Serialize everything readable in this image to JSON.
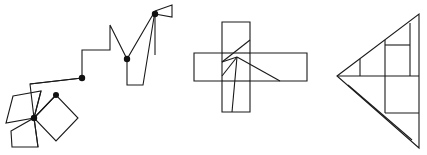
{
  "page": {
    "background_color": "#ffffff",
    "stroke_color": "#1a1a1a",
    "dot_color": "#111111",
    "stroke_width": 1.1,
    "width": 427,
    "height": 155
  },
  "figures": [
    {
      "id": "figure-left-staircase-pinwheel",
      "name": "staircase-with-pinwheel",
      "label": "Left figure: ascending staircase polyline with pinwheel of squares and a flag",
      "paths": [
        {
          "name": "pinwheel-square-lower-left",
          "closed": true,
          "points": [
            [
              13,
              96
            ],
            [
              41,
              91
            ],
            [
              34,
              118
            ],
            [
              6,
              123
            ]
          ]
        },
        {
          "name": "pinwheel-square-lower-bottom",
          "closed": true,
          "points": [
            [
              11,
              131
            ],
            [
              34,
              118
            ],
            [
              38,
              147
            ],
            [
              12,
              147
            ]
          ]
        },
        {
          "name": "pinwheel-square-diamond",
          "closed": true,
          "points": [
            [
              34,
              118
            ],
            [
              56,
              95
            ],
            [
              78,
              118
            ],
            [
              56,
              141
            ]
          ]
        },
        {
          "name": "pinwheel-spoke-a",
          "closed": false,
          "points": [
            [
              34,
              118
            ],
            [
              56,
              95
            ]
          ]
        },
        {
          "name": "pinwheel-spoke-b",
          "closed": false,
          "points": [
            [
              34,
              118
            ],
            [
              41,
              91
            ]
          ]
        },
        {
          "name": "pinwheel-spoke-c",
          "closed": false,
          "points": [
            [
              34,
              118
            ],
            [
              38,
              147
            ]
          ]
        },
        {
          "name": "staircase-main-polyline",
          "closed": false,
          "points": [
            [
              34,
              118
            ],
            [
              30,
              84
            ],
            [
              82,
              78
            ],
            [
              82,
              50
            ],
            [
              110,
              50
            ],
            [
              110,
              25
            ],
            [
              127,
              59
            ],
            [
              155,
              11
            ],
            [
              143,
              85
            ],
            [
              127,
              85
            ],
            [
              127,
              59
            ]
          ]
        },
        {
          "name": "staircase-lower-shelf",
          "closed": false,
          "points": [
            [
              30,
              84
            ],
            [
              82,
              78
            ]
          ]
        },
        {
          "name": "flag-triangle",
          "closed": false,
          "points": [
            [
              155,
              11
            ],
            [
              172,
              5
            ],
            [
              172,
              17
            ],
            [
              155,
              14
            ]
          ]
        },
        {
          "name": "mast-line",
          "closed": false,
          "points": [
            [
              155,
              14
            ],
            [
              155,
              55
            ]
          ]
        }
      ],
      "vertex_dots": [
        {
          "name": "dot-pinwheel-center",
          "cx": 34,
          "cy": 118,
          "r": 3.2
        },
        {
          "name": "dot-diamond-top",
          "cx": 56,
          "cy": 95,
          "r": 3.0
        },
        {
          "name": "dot-stair-joint",
          "cx": 82,
          "cy": 78,
          "r": 3.2
        },
        {
          "name": "dot-stair-upper",
          "cx": 127,
          "cy": 59,
          "r": 3.2
        },
        {
          "name": "dot-flag-base",
          "cx": 155,
          "cy": 14,
          "r": 3.2
        }
      ]
    },
    {
      "id": "figure-middle-cross",
      "name": "cross-with-internal-lines",
      "label": "Middle figure: plus/cross made of two overlapping rectangles with internal diagonal lines",
      "paths": [
        {
          "name": "cross-outline",
          "closed": true,
          "points": [
            [
              222,
              22
            ],
            [
              250,
              22
            ],
            [
              250,
              53
            ],
            [
              307,
              53
            ],
            [
              307,
              81
            ],
            [
              250,
              81
            ],
            [
              250,
              112
            ],
            [
              222,
              112
            ],
            [
              222,
              81
            ],
            [
              194,
              81
            ],
            [
              194,
              53
            ],
            [
              222,
              53
            ]
          ]
        },
        {
          "name": "cross-vertical-bar-left-edge",
          "closed": false,
          "points": [
            [
              222,
              53
            ],
            [
              222,
              81
            ]
          ]
        },
        {
          "name": "cross-vertical-bar-right-edge",
          "closed": false,
          "points": [
            [
              250,
              53
            ],
            [
              250,
              81
            ]
          ]
        },
        {
          "name": "cross-horizontal-bar-top-edge",
          "closed": false,
          "points": [
            [
              222,
              53
            ],
            [
              250,
              53
            ]
          ]
        },
        {
          "name": "cross-horizontal-bar-bottom-edge",
          "closed": false,
          "points": [
            [
              222,
              81
            ],
            [
              250,
              81
            ]
          ]
        },
        {
          "name": "internal-diagonal-upper",
          "closed": false,
          "points": [
            [
              222,
              62
            ],
            [
              250,
              40
            ]
          ]
        },
        {
          "name": "internal-diagonal-to-center",
          "closed": false,
          "points": [
            [
              222,
              62
            ],
            [
              237,
              57
            ]
          ]
        },
        {
          "name": "internal-fan-left",
          "closed": false,
          "points": [
            [
              237,
              57
            ],
            [
              222,
              76
            ]
          ]
        },
        {
          "name": "internal-fan-down",
          "closed": false,
          "points": [
            [
              237,
              57
            ],
            [
              232,
              112
            ]
          ]
        },
        {
          "name": "internal-fan-right",
          "closed": false,
          "points": [
            [
              237,
              57
            ],
            [
              280,
              81
            ]
          ]
        }
      ],
      "vertex_dots": []
    },
    {
      "id": "figure-right-triangle",
      "name": "triangle-with-internal-rectangles",
      "label": "Right figure: large left-pointing triangle subdivided by rectangles and a diagonal",
      "paths": [
        {
          "name": "triangle-outline",
          "closed": true,
          "points": [
            [
              337,
              76
            ],
            [
              419,
              14
            ],
            [
              419,
              148
            ]
          ]
        },
        {
          "name": "triangle-horizontal-midline",
          "closed": false,
          "points": [
            [
              337,
              76
            ],
            [
              419,
              76
            ]
          ]
        },
        {
          "name": "upper-small-vertical-left",
          "closed": false,
          "points": [
            [
              360,
              59
            ],
            [
              360,
              76
            ]
          ]
        },
        {
          "name": "upper-rect-vertical-mid",
          "closed": false,
          "points": [
            [
              385,
              40
            ],
            [
              385,
              76
            ]
          ]
        },
        {
          "name": "upper-rect-horizontal",
          "closed": false,
          "points": [
            [
              385,
              45
            ],
            [
              410,
              45
            ]
          ]
        },
        {
          "name": "upper-rect-vertical-right",
          "closed": false,
          "points": [
            [
              410,
              23
            ],
            [
              410,
              76
            ]
          ]
        },
        {
          "name": "lower-rect-vertical-left",
          "closed": false,
          "points": [
            [
              385,
              76
            ],
            [
              385,
              113
            ]
          ]
        },
        {
          "name": "lower-rect-horizontal",
          "closed": false,
          "points": [
            [
              385,
              113
            ],
            [
              419,
              113
            ]
          ]
        },
        {
          "name": "lower-diagonal",
          "closed": false,
          "points": [
            [
              348,
              85
            ],
            [
              412,
              140
            ]
          ]
        }
      ],
      "vertex_dots": []
    }
  ]
}
